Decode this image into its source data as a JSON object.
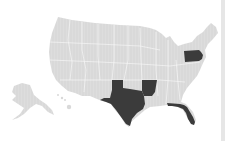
{
  "map": {
    "title": "United States map with highlighted states",
    "base_color": "#d9d9d9",
    "highlight_color": "#3b3b3b",
    "border_color": "#ffffff",
    "highlighted_states": [
      "Texas",
      "Arkansas",
      "Florida",
      "Pennsylvania"
    ],
    "other_regions": [
      "Continental US",
      "Alaska",
      "Hawaii"
    ]
  }
}
